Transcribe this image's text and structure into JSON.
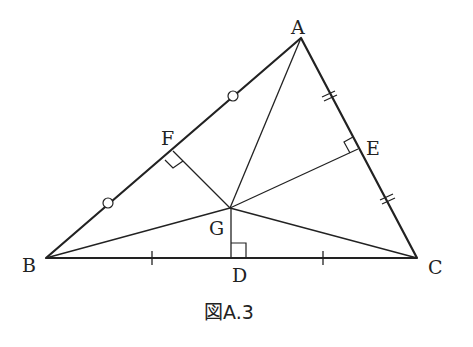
{
  "figure": {
    "caption": "図A.3",
    "labels": {
      "A": "A",
      "B": "B",
      "C": "C",
      "D": "D",
      "E": "E",
      "F": "F",
      "G": "G"
    },
    "points": {
      "A": [
        301,
        38
      ],
      "B": [
        46,
        258
      ],
      "C": [
        417,
        258
      ],
      "D": [
        231,
        258
      ],
      "E": [
        358,
        149
      ],
      "F": [
        173,
        151
      ],
      "G": [
        230,
        208
      ]
    }
  }
}
